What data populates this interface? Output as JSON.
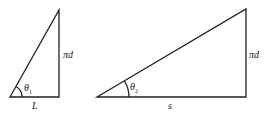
{
  "diagram": {
    "triangles": [
      {
        "id": "left-triangle",
        "vertices": {
          "bottom_left": [
            10,
            97
          ],
          "top": [
            59,
            10
          ],
          "bottom_right": [
            59,
            97
          ]
        },
        "labels": {
          "vertical": "πd",
          "base": "L",
          "angle": "θ",
          "angle_sub": "1"
        }
      },
      {
        "id": "right-triangle",
        "vertices": {
          "bottom_left": [
            97,
            97
          ],
          "top": [
            246,
            9
          ],
          "bottom_right": [
            246,
            97
          ]
        },
        "labels": {
          "vertical": "πd",
          "base": "s",
          "angle": "θ",
          "angle_sub": "2"
        }
      }
    ],
    "line_color": "#222222"
  }
}
